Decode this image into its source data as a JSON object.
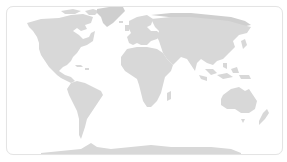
{
  "map": {
    "type": "world-map",
    "projection": "equirectangular",
    "style": "silhouette",
    "colors": {
      "land": "#d8d8d8",
      "land_dark": "#cfcfcf",
      "ocean": "#ffffff",
      "border": "#e4e4e4"
    },
    "regions": [
      {
        "id": "north-america",
        "label": "North America"
      },
      {
        "id": "greenland",
        "label": "Greenland"
      },
      {
        "id": "south-america",
        "label": "South America"
      },
      {
        "id": "europe",
        "label": "Europe"
      },
      {
        "id": "africa",
        "label": "Africa"
      },
      {
        "id": "asia",
        "label": "Asia"
      },
      {
        "id": "australia",
        "label": "Australia"
      },
      {
        "id": "antarctica",
        "label": "Antarctica"
      }
    ]
  }
}
